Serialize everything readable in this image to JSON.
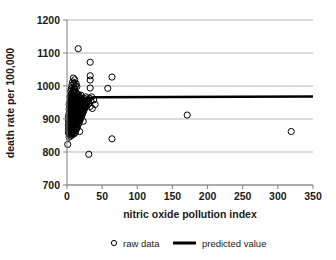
{
  "chart_data": {
    "type": "scatter",
    "title": "",
    "xlabel": "nitric oxide pollution index",
    "ylabel": "death rate per 100,000",
    "xlim": [
      0,
      350
    ],
    "ylim": [
      700,
      1200
    ],
    "xticks": [
      0,
      50,
      100,
      150,
      200,
      250,
      300,
      350
    ],
    "yticks": [
      700,
      800,
      900,
      1000,
      1100,
      1200
    ],
    "xtick_labels": [
      "0",
      "50",
      "100",
      "150",
      "200",
      "250",
      "300",
      "350"
    ],
    "ytick_labels": [
      "700",
      "800",
      "900",
      "1000",
      "1100",
      "1200"
    ],
    "grid": "horizontal",
    "legend_position": "bottom",
    "series": [
      {
        "name": "raw data",
        "type": "scatter",
        "marker": "open-circle",
        "color": "#000000",
        "points": [
          [
            1,
            823
          ],
          [
            2,
            857
          ],
          [
            2,
            869
          ],
          [
            2,
            882
          ],
          [
            2,
            895
          ],
          [
            2,
            908
          ],
          [
            3,
            845
          ],
          [
            3,
            861
          ],
          [
            3,
            874
          ],
          [
            3,
            889
          ],
          [
            3,
            901
          ],
          [
            3,
            917
          ],
          [
            3,
            930
          ],
          [
            3,
            944
          ],
          [
            4,
            853
          ],
          [
            4,
            866
          ],
          [
            4,
            878
          ],
          [
            4,
            892
          ],
          [
            4,
            905
          ],
          [
            4,
            921
          ],
          [
            4,
            936
          ],
          [
            4,
            952
          ],
          [
            4,
            966
          ],
          [
            5,
            848
          ],
          [
            5,
            863
          ],
          [
            5,
            877
          ],
          [
            5,
            890
          ],
          [
            5,
            903
          ],
          [
            5,
            915
          ],
          [
            5,
            928
          ],
          [
            5,
            941
          ],
          [
            5,
            955
          ],
          [
            5,
            970
          ],
          [
            5,
            984
          ],
          [
            6,
            856
          ],
          [
            6,
            871
          ],
          [
            6,
            884
          ],
          [
            6,
            897
          ],
          [
            6,
            910
          ],
          [
            6,
            924
          ],
          [
            6,
            938
          ],
          [
            6,
            951
          ],
          [
            6,
            963
          ],
          [
            6,
            977
          ],
          [
            6,
            992
          ],
          [
            7,
            851
          ],
          [
            7,
            867
          ],
          [
            7,
            880
          ],
          [
            7,
            893
          ],
          [
            7,
            906
          ],
          [
            7,
            919
          ],
          [
            7,
            933
          ],
          [
            7,
            947
          ],
          [
            7,
            961
          ],
          [
            7,
            975
          ],
          [
            7,
            1002
          ],
          [
            8,
            858
          ],
          [
            8,
            873
          ],
          [
            8,
            888
          ],
          [
            8,
            900
          ],
          [
            8,
            913
          ],
          [
            8,
            927
          ],
          [
            8,
            940
          ],
          [
            8,
            954
          ],
          [
            8,
            968
          ],
          [
            8,
            983
          ],
          [
            8,
            1012
          ],
          [
            9,
            862
          ],
          [
            9,
            876
          ],
          [
            9,
            891
          ],
          [
            9,
            904
          ],
          [
            9,
            918
          ],
          [
            9,
            932
          ],
          [
            9,
            946
          ],
          [
            9,
            959
          ],
          [
            9,
            973
          ],
          [
            9,
            988
          ],
          [
            9,
            1024
          ],
          [
            10,
            855
          ],
          [
            10,
            870
          ],
          [
            10,
            885
          ],
          [
            10,
            899
          ],
          [
            10,
            912
          ],
          [
            10,
            926
          ],
          [
            10,
            939
          ],
          [
            10,
            953
          ],
          [
            10,
            967
          ],
          [
            10,
            981
          ],
          [
            10,
            996
          ],
          [
            10,
            1008
          ],
          [
            11,
            864
          ],
          [
            11,
            879
          ],
          [
            11,
            894
          ],
          [
            11,
            907
          ],
          [
            11,
            921
          ],
          [
            11,
            935
          ],
          [
            11,
            949
          ],
          [
            11,
            962
          ],
          [
            11,
            976
          ],
          [
            11,
            990
          ],
          [
            11,
            1019
          ],
          [
            12,
            859
          ],
          [
            12,
            875
          ],
          [
            12,
            889
          ],
          [
            12,
            902
          ],
          [
            12,
            916
          ],
          [
            12,
            930
          ],
          [
            12,
            943
          ],
          [
            12,
            957
          ],
          [
            12,
            971
          ],
          [
            12,
            1001
          ],
          [
            13,
            868
          ],
          [
            13,
            883
          ],
          [
            13,
            897
          ],
          [
            13,
            911
          ],
          [
            13,
            925
          ],
          [
            13,
            938
          ],
          [
            13,
            952
          ],
          [
            13,
            966
          ],
          [
            13,
            980
          ],
          [
            13,
            1007
          ],
          [
            14,
            872
          ],
          [
            14,
            886
          ],
          [
            14,
            900
          ],
          [
            14,
            914
          ],
          [
            14,
            928
          ],
          [
            14,
            942
          ],
          [
            14,
            956
          ],
          [
            14,
            970
          ],
          [
            14,
            998
          ],
          [
            15,
            877
          ],
          [
            15,
            891
          ],
          [
            15,
            905
          ],
          [
            15,
            919
          ],
          [
            15,
            933
          ],
          [
            15,
            947
          ],
          [
            15,
            961
          ],
          [
            15,
            975
          ],
          [
            16,
            1113
          ],
          [
            16,
            884
          ],
          [
            16,
            898
          ],
          [
            16,
            912
          ],
          [
            16,
            926
          ],
          [
            16,
            940
          ],
          [
            16,
            954
          ],
          [
            16,
            968
          ],
          [
            17,
            889
          ],
          [
            17,
            903
          ],
          [
            17,
            917
          ],
          [
            17,
            931
          ],
          [
            17,
            945
          ],
          [
            17,
            959
          ],
          [
            17,
            973
          ],
          [
            18,
            862
          ],
          [
            18,
            894
          ],
          [
            18,
            908
          ],
          [
            18,
            922
          ],
          [
            18,
            936
          ],
          [
            18,
            950
          ],
          [
            19,
            899
          ],
          [
            19,
            913
          ],
          [
            19,
            927
          ],
          [
            19,
            941
          ],
          [
            19,
            964
          ],
          [
            20,
            905
          ],
          [
            20,
            919
          ],
          [
            20,
            933
          ],
          [
            20,
            947
          ],
          [
            20,
            972
          ],
          [
            21,
            910
          ],
          [
            21,
            924
          ],
          [
            21,
            938
          ],
          [
            21,
            955
          ],
          [
            22,
            915
          ],
          [
            22,
            929
          ],
          [
            22,
            943
          ],
          [
            22,
            960
          ],
          [
            23,
            893
          ],
          [
            23,
            921
          ],
          [
            23,
            935
          ],
          [
            23,
            949
          ],
          [
            24,
            926
          ],
          [
            24,
            940
          ],
          [
            24,
            958
          ],
          [
            25,
            931
          ],
          [
            25,
            945
          ],
          [
            25,
            962
          ],
          [
            26,
            936
          ],
          [
            26,
            950
          ],
          [
            27,
            941
          ],
          [
            27,
            967
          ],
          [
            28,
            946
          ],
          [
            28,
            955
          ],
          [
            29,
            951
          ],
          [
            30,
            958
          ],
          [
            31,
            793
          ],
          [
            31,
            948
          ],
          [
            32,
            963
          ],
          [
            33,
            1072
          ],
          [
            33,
            1031
          ],
          [
            33,
            1018
          ],
          [
            33,
            994
          ],
          [
            33,
            938
          ],
          [
            34,
            955
          ],
          [
            35,
            967
          ],
          [
            36,
            932
          ],
          [
            38,
            958
          ],
          [
            40,
            944
          ],
          [
            58,
            993
          ],
          [
            64,
            1027
          ],
          [
            64,
            840
          ],
          [
            171,
            912
          ],
          [
            319,
            862
          ]
        ]
      },
      {
        "name": "predicted value",
        "type": "line",
        "color": "#000000",
        "points": [
          [
            3,
            957
          ],
          [
            40,
            966
          ],
          [
            350,
            968
          ]
        ]
      }
    ]
  },
  "legend": {
    "items": [
      {
        "label": "raw data",
        "marker": "open-circle-marker"
      },
      {
        "label": "predicted value",
        "marker": "thick-line-marker"
      }
    ]
  },
  "colors": {
    "grid": "#a6a6a6",
    "axis": "#7f7f7f",
    "marker": "#000000",
    "trend": "#000000",
    "background": "#ffffff"
  }
}
